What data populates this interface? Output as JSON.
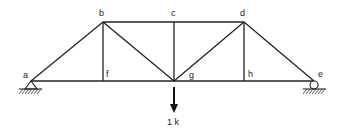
{
  "diagram": {
    "type": "truss",
    "joints": {
      "a": {
        "label": "a",
        "x": 31,
        "y": 81
      },
      "b": {
        "label": "b",
        "x": 103,
        "y": 22
      },
      "c": {
        "label": "c",
        "x": 174,
        "y": 22
      },
      "d": {
        "label": "d",
        "x": 244,
        "y": 22
      },
      "e": {
        "label": "e",
        "x": 314,
        "y": 81
      },
      "f": {
        "label": "f",
        "x": 103,
        "y": 81
      },
      "g": {
        "label": "g",
        "x": 174,
        "y": 81
      },
      "h": {
        "label": "h",
        "x": 244,
        "y": 81
      }
    },
    "members": [
      [
        "a",
        "b"
      ],
      [
        "b",
        "c"
      ],
      [
        "c",
        "d"
      ],
      [
        "d",
        "e"
      ],
      [
        "a",
        "f"
      ],
      [
        "f",
        "g"
      ],
      [
        "g",
        "h"
      ],
      [
        "h",
        "e"
      ],
      [
        "b",
        "f"
      ],
      [
        "c",
        "g"
      ],
      [
        "d",
        "h"
      ],
      [
        "b",
        "g"
      ],
      [
        "g",
        "d"
      ]
    ],
    "supports": {
      "a": "pin",
      "e": "roller"
    },
    "load": {
      "joint": "g",
      "direction": "down",
      "label": "1 k"
    }
  },
  "colors": {
    "line": "#222222",
    "background": "#ffffff"
  }
}
